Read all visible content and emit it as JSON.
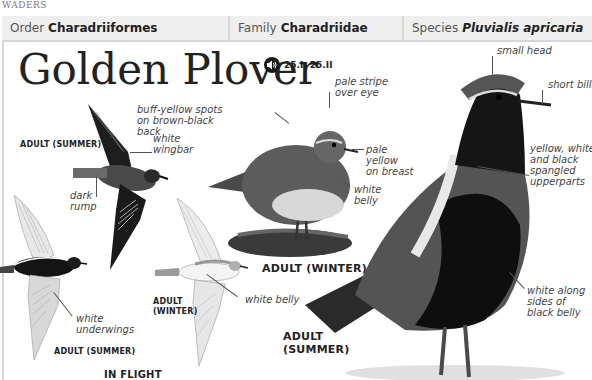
{
  "section": "WADERS",
  "taxonomy": {
    "order": {
      "key": "Order",
      "value": "Charadriiformes"
    },
    "family": {
      "key": "Family",
      "value": "Charadriidae"
    },
    "species": {
      "key": "Species",
      "value": "Pluvialis apricaria"
    }
  },
  "title": "Golden Plover",
  "audio": {
    "icon": "speaker-icon",
    "reference": "25.I, 25.II"
  },
  "illustrations": {
    "flight_summer_top": {
      "label": "ADULT (SUMMER)",
      "annotations": [
        "white wingbar",
        "dark rump"
      ]
    },
    "flight_summer_under": {
      "label": "ADULT (SUMMER)",
      "annotations": [
        "white underwings"
      ]
    },
    "flight_winter": {
      "label": "ADULT (WINTER)",
      "annotations": [
        "white belly"
      ]
    },
    "flight_group_caption": "IN FLIGHT",
    "standing_winter": {
      "label": "ADULT (WINTER)",
      "annotations": [
        "buff-yellow spots on brown-black back",
        "pale stripe over eye",
        "pale yellow on breast",
        "white belly"
      ]
    },
    "standing_summer": {
      "label": "ADULT (SUMMER)",
      "annotations": [
        "small head",
        "short bill",
        "yellow, white, and black spangled upperparts",
        "white along sides of black belly"
      ]
    }
  },
  "text": {
    "wingbar_l1": "white",
    "wingbar_l2": "wingbar",
    "rump_l1": "dark",
    "rump_l2": "rump",
    "underwings_l1": "white",
    "underwings_l2": "underwings",
    "flight_winter_belly": "white belly",
    "fw_label_l1": "ADULT",
    "fw_label_l2": "(WINTER)",
    "buff_l1": "buff-yellow spots",
    "buff_l2": "on brown-black",
    "buff_l3": "back",
    "stripe_l1": "pale stripe",
    "stripe_l2": "over eye",
    "breast_l1": "pale",
    "breast_l2": "yellow",
    "breast_l3": "on breast",
    "wbelly_l1": "white",
    "wbelly_l2": "belly",
    "ss_label_l1": "ADULT",
    "ss_label_l2": "(SUMMER)",
    "spangled_l1": "yellow, white,",
    "spangled_l2": "and black",
    "spangled_l3": "spangled",
    "spangled_l4": "upperparts",
    "along_l1": "white along",
    "along_l2": "sides of",
    "along_l3": "black belly"
  }
}
